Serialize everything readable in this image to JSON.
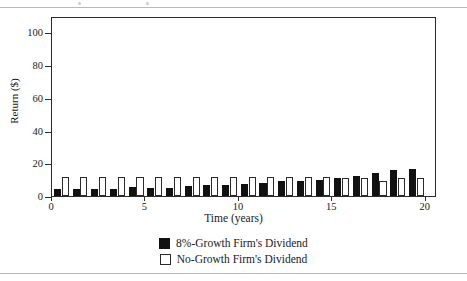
{
  "figure": {
    "separator_top": "rule",
    "separator_bottom": "rule"
  },
  "chart_data": {
    "type": "bar",
    "title": "",
    "xlabel": "Time (years)",
    "ylabel": "Return ($)",
    "xlim": [
      0,
      20.6
    ],
    "ylim": [
      0,
      110
    ],
    "ytick_labels": [
      "0",
      "20",
      "40",
      "60",
      "80",
      "100"
    ],
    "yticks": [
      0,
      20,
      40,
      60,
      80,
      100
    ],
    "xtick_labels": [
      "0",
      "5",
      "10",
      "15",
      "20"
    ],
    "xticks": [
      0,
      5,
      10,
      15,
      20
    ],
    "grid": false,
    "legend_position": "below",
    "categories": [
      1,
      2,
      3,
      4,
      5,
      6,
      7,
      8,
      9,
      10,
      11,
      12,
      13,
      14,
      15,
      16,
      17,
      18,
      19,
      20
    ],
    "series": [
      {
        "name": "8%-Growth Firm's Dividend",
        "color": "#111111",
        "style": "filled",
        "values": [
          4.0,
          4.1,
          4.2,
          4.4,
          5.4,
          4.8,
          5.1,
          6.1,
          6.5,
          6.6,
          7.4,
          7.8,
          9.4,
          9.3,
          9.7,
          11.3,
          12.4,
          14.2,
          15.6,
          16.3
        ]
      },
      {
        "name": "No-Growth Firm's Dividend",
        "color": "#ffffff",
        "style": "outlined",
        "values": [
          11.4,
          11.6,
          11.6,
          11.5,
          11.6,
          11.6,
          11.5,
          11.6,
          11.5,
          11.8,
          11.6,
          11.5,
          11.6,
          11.7,
          11.6,
          10.8,
          11.2,
          9.2,
          11.2,
          11.0
        ]
      }
    ]
  },
  "legend": {
    "items": [
      {
        "label": "8%-Growth Firm's Dividend",
        "swatch": "black"
      },
      {
        "label": "No-Growth Firm's Dividend",
        "swatch": "white"
      }
    ]
  }
}
